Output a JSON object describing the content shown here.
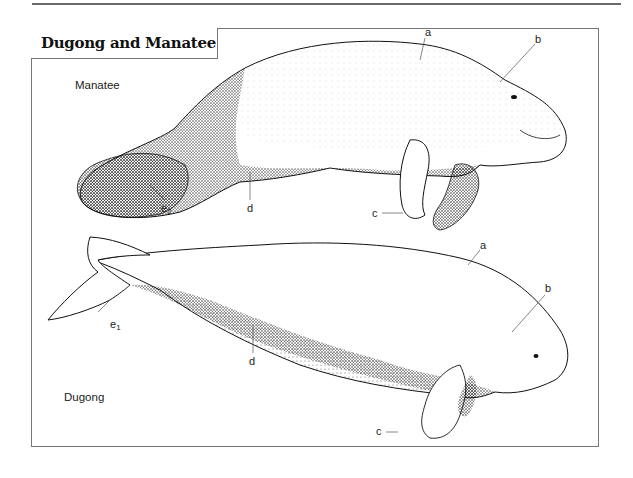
{
  "figure": {
    "title": "Dugong and Manatee",
    "species": [
      {
        "name": "Manatee",
        "labels": {
          "a": "a",
          "b": "b",
          "c": "c",
          "d": "d",
          "e": "e",
          "e_sub": "2"
        }
      },
      {
        "name": "Dugong",
        "labels": {
          "a": "a",
          "b": "b",
          "c": "c",
          "d": "d",
          "e": "e",
          "e_sub": "1"
        }
      }
    ],
    "colors": {
      "frame": "#777777",
      "ink": "#111111",
      "stipple": "#222222"
    }
  }
}
